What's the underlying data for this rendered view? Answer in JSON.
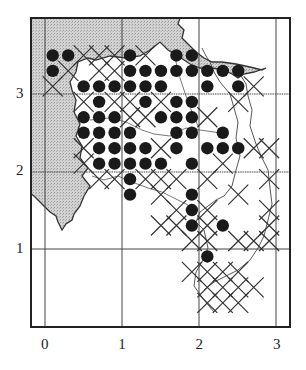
{
  "map": {
    "type": "distribution-grid-map",
    "frame": {
      "left": 30,
      "top": 17,
      "right": 291,
      "bottom": 328
    },
    "origin_px": {
      "x": 45,
      "y": 326
    },
    "unit_px": 77.3,
    "x_ticks": [
      {
        "value": 0,
        "label": "0"
      },
      {
        "value": 1,
        "label": "1"
      },
      {
        "value": 2,
        "label": "2"
      },
      {
        "value": 3,
        "label": "3"
      }
    ],
    "y_ticks": [
      {
        "value": 1,
        "label": "1"
      },
      {
        "value": 2,
        "label": "2"
      },
      {
        "value": 3,
        "label": "3"
      }
    ],
    "colors": {
      "sea": "#c9c9c9",
      "land": "#ffffff",
      "line": "#333333",
      "dot": "#1a1a1a"
    },
    "legend_symbols": {
      "filled_circle": "present (recorded)",
      "cross": "other record"
    },
    "dots": [
      [
        0.1,
        3.5
      ],
      [
        0.3,
        3.5
      ],
      [
        1.1,
        3.5
      ],
      [
        1.7,
        3.5
      ],
      [
        1.9,
        3.5
      ],
      [
        0.1,
        3.3
      ],
      [
        1.1,
        3.3
      ],
      [
        1.3,
        3.3
      ],
      [
        1.5,
        3.3
      ],
      [
        1.7,
        3.3
      ],
      [
        1.9,
        3.3
      ],
      [
        2.1,
        3.3
      ],
      [
        2.3,
        3.3
      ],
      [
        2.5,
        3.3
      ],
      [
        0.5,
        3.1
      ],
      [
        0.7,
        3.1
      ],
      [
        0.9,
        3.1
      ],
      [
        1.1,
        3.1
      ],
      [
        1.3,
        3.1
      ],
      [
        1.5,
        3.1
      ],
      [
        2.1,
        3.1
      ],
      [
        2.5,
        3.1
      ],
      [
        0.7,
        2.9
      ],
      [
        1.3,
        2.9
      ],
      [
        1.7,
        2.9
      ],
      [
        1.9,
        2.9
      ],
      [
        0.5,
        2.7
      ],
      [
        0.7,
        2.7
      ],
      [
        0.9,
        2.7
      ],
      [
        1.5,
        2.7
      ],
      [
        1.7,
        2.7
      ],
      [
        1.9,
        2.7
      ],
      [
        0.5,
        2.5
      ],
      [
        0.7,
        2.5
      ],
      [
        0.9,
        2.5
      ],
      [
        1.1,
        2.5
      ],
      [
        1.7,
        2.5
      ],
      [
        1.9,
        2.5
      ],
      [
        2.3,
        2.5
      ],
      [
        0.7,
        2.3
      ],
      [
        0.9,
        2.3
      ],
      [
        1.1,
        2.3
      ],
      [
        1.3,
        2.3
      ],
      [
        1.7,
        2.3
      ],
      [
        2.1,
        2.3
      ],
      [
        2.3,
        2.3
      ],
      [
        2.5,
        2.3
      ],
      [
        0.7,
        2.1
      ],
      [
        0.9,
        2.1
      ],
      [
        1.1,
        2.1
      ],
      [
        1.3,
        2.1
      ],
      [
        1.5,
        2.1
      ],
      [
        1.9,
        2.1
      ],
      [
        1.1,
        1.9
      ],
      [
        1.1,
        1.7
      ],
      [
        1.9,
        1.7
      ],
      [
        1.9,
        1.5
      ],
      [
        1.9,
        1.3
      ],
      [
        2.3,
        1.3
      ],
      [
        2.1,
        0.9
      ]
    ],
    "crosses": [
      [
        0.5,
        3.5
      ],
      [
        0.7,
        3.5
      ],
      [
        0.9,
        3.5
      ],
      [
        1.3,
        3.5
      ],
      [
        0.3,
        3.3
      ],
      [
        0.7,
        3.3
      ],
      [
        0.9,
        3.3
      ],
      [
        0.1,
        3.1
      ],
      [
        2.7,
        3.1
      ],
      [
        0.5,
        2.9
      ],
      [
        0.9,
        2.9
      ],
      [
        1.1,
        2.9
      ],
      [
        1.5,
        2.9
      ],
      [
        2.5,
        2.9
      ],
      [
        1.1,
        2.7
      ],
      [
        1.3,
        2.7
      ],
      [
        2.1,
        2.7
      ],
      [
        0.5,
        2.3
      ],
      [
        1.5,
        2.3
      ],
      [
        2.7,
        2.3
      ],
      [
        0.5,
        2.1
      ],
      [
        0.7,
        1.9
      ],
      [
        1.5,
        1.9
      ],
      [
        2.3,
        2.1
      ],
      [
        2.9,
        2.3
      ],
      [
        0.9,
        1.9
      ],
      [
        1.3,
        1.9
      ],
      [
        1.7,
        1.9
      ],
      [
        2.1,
        1.9
      ],
      [
        1.5,
        1.7
      ],
      [
        2.5,
        1.7
      ],
      [
        2.9,
        1.9
      ],
      [
        1.7,
        1.5
      ],
      [
        2.1,
        1.5
      ],
      [
        2.9,
        1.5
      ],
      [
        1.5,
        1.3
      ],
      [
        1.7,
        1.3
      ],
      [
        2.1,
        1.3
      ],
      [
        2.9,
        1.3
      ],
      [
        2.5,
        1.1
      ],
      [
        2.7,
        1.1
      ],
      [
        2.9,
        1.1
      ],
      [
        1.9,
        1.1
      ],
      [
        2.1,
        1.1
      ],
      [
        1.9,
        0.7
      ],
      [
        2.1,
        0.7
      ],
      [
        2.3,
        0.7
      ],
      [
        2.5,
        0.7
      ],
      [
        2.1,
        0.5
      ],
      [
        2.3,
        0.5
      ],
      [
        2.5,
        0.5
      ],
      [
        2.7,
        0.5
      ],
      [
        2.3,
        0.3
      ],
      [
        2.5,
        0.3
      ],
      [
        2.1,
        0.3
      ]
    ]
  }
}
